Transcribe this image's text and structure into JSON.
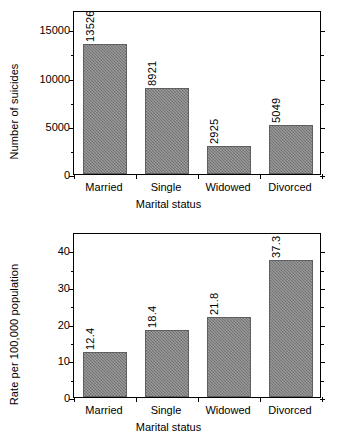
{
  "chart_data": [
    {
      "type": "bar",
      "title": "",
      "xlabel": "Marital status",
      "ylabel": "Number of suicides",
      "categories": [
        "Married",
        "Single",
        "Widowed",
        "Divorced"
      ],
      "values": [
        13526,
        8921,
        2925,
        5049
      ],
      "data_labels": [
        "13526",
        "8921",
        "2925",
        "5049"
      ],
      "ylim": [
        0,
        17000
      ],
      "ytick_labels": [
        "0",
        "5000",
        "10000",
        "15000"
      ],
      "ytick_values": [
        0,
        5000,
        10000,
        15000
      ],
      "yminor_values": [
        2500,
        7500,
        12500
      ],
      "grid": false,
      "legend": "none",
      "bar_color": "#7d7d7d",
      "axis_color": "#000000"
    },
    {
      "type": "bar",
      "title": "",
      "xlabel": "Marital status",
      "ylabel": "Rate per 100,000 population",
      "categories": [
        "Married",
        "Single",
        "Widowed",
        "Divorced"
      ],
      "values": [
        12.4,
        18.4,
        21.8,
        37.3
      ],
      "data_labels": [
        "12.4",
        "18.4",
        "21.8",
        "37.3"
      ],
      "ylim": [
        0,
        45
      ],
      "ytick_labels": [
        "0",
        "10",
        "20",
        "30",
        "40"
      ],
      "ytick_values": [
        0,
        10,
        20,
        30,
        40
      ],
      "yminor_values": [
        5,
        15,
        25,
        35
      ],
      "grid": false,
      "legend": "none",
      "bar_color": "#7d7d7d",
      "axis_color": "#000000"
    }
  ]
}
